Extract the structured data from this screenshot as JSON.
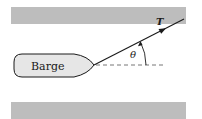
{
  "diagram": {
    "barge_label": "Barge",
    "tension_label": "T",
    "angle_label": "θ",
    "colors": {
      "bank": "#bdbdbd",
      "hull_fill": "#e6e6e6",
      "ink": "#1a1a1a",
      "dashed": "#666666"
    }
  }
}
